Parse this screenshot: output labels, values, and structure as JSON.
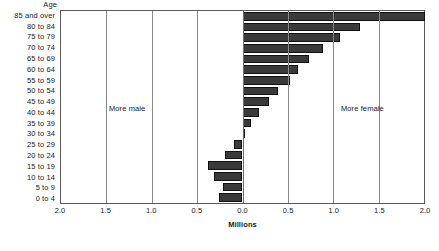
{
  "figure": {
    "axis_title_age": "Age",
    "xaxis_title": "Millions",
    "annotation_more_male": "More male",
    "annotation_more_female": "More female",
    "bar_color": "#3a3a3a",
    "bar_edge_color": "#101010",
    "frame_color": "#5a5a5a",
    "grid_color": "#8a8a8a",
    "background": "#ffffff"
  },
  "chart_data": {
    "type": "bar",
    "orientation": "horizontal",
    "title": "",
    "subtitle": "",
    "xlabel": "Millions",
    "ylabel": "Age",
    "xlim": [
      -2.0,
      2.0
    ],
    "grid": true,
    "legend": "none",
    "annotations": [
      "More male",
      "More female"
    ],
    "xtick_labels": [
      "2.0",
      "1.5",
      "1.0",
      "0.5",
      "0.0",
      "0.5",
      "1.0",
      "1.5",
      "2.0"
    ],
    "xtick_values": [
      -2.0,
      -1.5,
      -1.0,
      -0.5,
      0.0,
      0.5,
      1.0,
      1.5,
      2.0
    ],
    "note": "Positive values extend right (more female); negative values extend left (more male).",
    "categories": [
      "85 and over",
      "80 to 84",
      "75 to 79",
      "70 to 74",
      "65 to 69",
      "60 to 64",
      "55 to 59",
      "50 to 54",
      "45 to 49",
      "40 to 44",
      "35 to 39",
      "30 to 34",
      "25 to 29",
      "20 to 24",
      "15 to 19",
      "10 to 14",
      "5 to 9",
      "0 to 4"
    ],
    "values": [
      2.01,
      1.29,
      1.07,
      0.89,
      0.73,
      0.61,
      0.52,
      0.39,
      0.29,
      0.18,
      0.09,
      0.02,
      -0.09,
      -0.19,
      -0.38,
      -0.31,
      -0.22,
      -0.26
    ]
  }
}
